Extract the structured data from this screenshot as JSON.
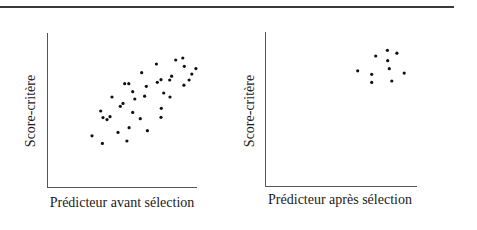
{
  "chart_data": [
    {
      "type": "scatter",
      "title": "",
      "xlabel": "Prédicteur avant sélection",
      "ylabel": "Score-critère",
      "xlim": [
        0,
        100
      ],
      "ylim": [
        0,
        100
      ],
      "grid": false,
      "legend": null,
      "ticks": "none",
      "points": [
        [
          72.9,
          80.0
        ],
        [
          85.8,
          82.6
        ],
        [
          90.5,
          83.9
        ],
        [
          91.5,
          78.5
        ],
        [
          99.3,
          77.0
        ],
        [
          96.5,
          73.5
        ],
        [
          63.1,
          74.4
        ],
        [
          83.1,
          72.1
        ],
        [
          81.8,
          69.7
        ],
        [
          76.0,
          69.9
        ],
        [
          73.5,
          68.2
        ],
        [
          94.7,
          69.7
        ],
        [
          91.3,
          66.3
        ],
        [
          51.8,
          67.3
        ],
        [
          54.5,
          67.3
        ],
        [
          66.2,
          65.6
        ],
        [
          57.1,
          62.1
        ],
        [
          77.8,
          61.3
        ],
        [
          82.0,
          58.7
        ],
        [
          65.1,
          59.2
        ],
        [
          58.5,
          57.4
        ],
        [
          43.3,
          58.7
        ],
        [
          50.7,
          54.6
        ],
        [
          48.9,
          52.7
        ],
        [
          35.8,
          49.7
        ],
        [
          57.1,
          48.8
        ],
        [
          76.2,
          51.4
        ],
        [
          37.3,
          45.4
        ],
        [
          40.0,
          44.1
        ],
        [
          42.0,
          46.0
        ],
        [
          76.0,
          45.6
        ],
        [
          62.2,
          44.7
        ],
        [
          54.7,
          38.9
        ],
        [
          47.3,
          35.9
        ],
        [
          66.9,
          37.0
        ],
        [
          30.0,
          33.7
        ],
        [
          36.9,
          28.8
        ],
        [
          53.3,
          30.3
        ]
      ]
    },
    {
      "type": "scatter",
      "title": "",
      "xlabel": "Prédicteur après sélection",
      "ylabel": "Score-critère",
      "xlim": [
        0,
        100
      ],
      "ylim": [
        0,
        100
      ],
      "grid": false,
      "legend": null,
      "ticks": "none",
      "points": [
        [
          80.5,
          88.2
        ],
        [
          86.8,
          86.3
        ],
        [
          72.8,
          84.5
        ],
        [
          80.7,
          81.5
        ],
        [
          81.8,
          76.3
        ],
        [
          61.0,
          75.0
        ],
        [
          70.2,
          72.7
        ],
        [
          91.6,
          73.5
        ],
        [
          70.2,
          67.5
        ],
        [
          83.4,
          68.4
        ]
      ]
    }
  ],
  "colors": {
    "axis": "#555555",
    "point": "#111111",
    "rule": "#3a3a3a"
  }
}
